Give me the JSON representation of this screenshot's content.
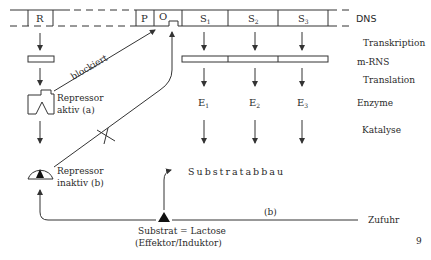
{
  "diagram": {
    "dna_genes": {
      "regulator": "R",
      "promoter": "P",
      "operator": "O",
      "structural": [
        {
          "letter": "S",
          "sub": "1"
        },
        {
          "letter": "S",
          "sub": "2"
        },
        {
          "letter": "S",
          "sub": "3"
        }
      ]
    },
    "right_labels": {
      "dns": "DNS",
      "transkription": "Transkription",
      "mrns": "m-RNS",
      "translation": "Translation",
      "enzyme": "Enzyme",
      "katalyse": "Katalyse"
    },
    "enzymes": [
      {
        "letter": "E",
        "sub": "1"
      },
      {
        "letter": "E",
        "sub": "2"
      },
      {
        "letter": "E",
        "sub": "3"
      }
    ],
    "repressor_active": {
      "line1": "Repressor",
      "line2": "aktiv  (a)"
    },
    "repressor_inactive": {
      "line1": "Repressor",
      "line2": "inaktiv  (b)"
    },
    "blockiert": "blockiert",
    "substratabbau": "Substratabbau",
    "substrate": {
      "line1": "Substrat = Lactose",
      "line2": "(Effektor/Induktor)"
    },
    "path_b_label": "(b)",
    "zufuhr": "Zufuhr",
    "page_number": "9"
  }
}
